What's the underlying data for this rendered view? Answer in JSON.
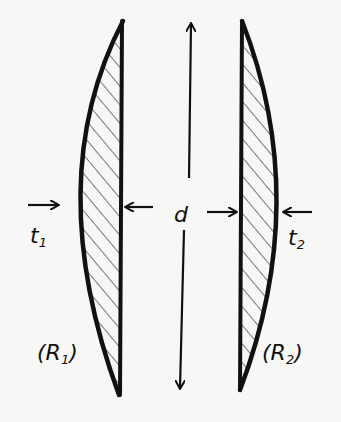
{
  "diagram": {
    "lenses": [
      {
        "name": "lens-1",
        "thickness_label": "t",
        "thickness_sub": "1",
        "radius_label": "(R",
        "radius_sub": "1",
        "radius_close": ")"
      },
      {
        "name": "lens-2",
        "thickness_label": "t",
        "thickness_sub": "2",
        "radius_label": "(R",
        "radius_sub": "2",
        "radius_close": ")"
      }
    ],
    "separation_label": "d",
    "colors": {
      "ink": "#111111",
      "background": "#f7f7f5"
    }
  }
}
